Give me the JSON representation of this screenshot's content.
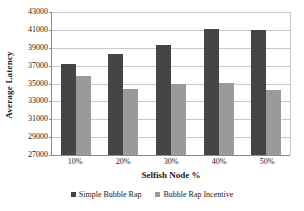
{
  "chart_data": {
    "type": "bar",
    "title": "",
    "xlabel": "Selfish Node %",
    "ylabel": "Average Latency",
    "categories": [
      "10%",
      "20%",
      "30%",
      "40%",
      "50%"
    ],
    "series": [
      {
        "name": "Simple Bubble Rap",
        "color": "#454545",
        "values": [
          37200,
          38300,
          39300,
          41100,
          41000
        ]
      },
      {
        "name": "Bubble Rap Incentive",
        "color": "#9a9a9a",
        "values": [
          35800,
          34400,
          35000,
          35100,
          34300
        ]
      }
    ],
    "ylim": [
      27000,
      43000
    ],
    "ytick_step": 2000,
    "yticks": [
      "43000",
      "41000",
      "39000",
      "37000",
      "35000",
      "33000",
      "31000",
      "29000",
      "27000"
    ],
    "grid": true,
    "legend_position": "bottom"
  }
}
